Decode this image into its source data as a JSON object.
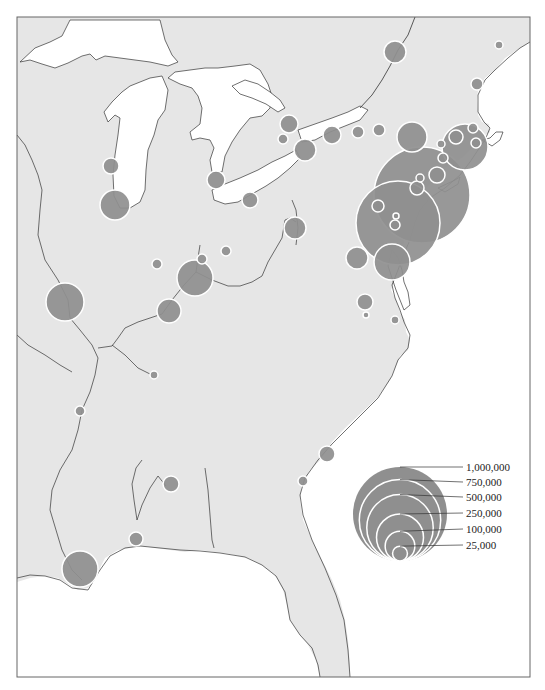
{
  "map": {
    "colors": {
      "land": "#e6e6e6",
      "water": "#ffffff",
      "circle_fill": "#8f8f8f",
      "circle_stroke": "#ffffff",
      "border": "#333333",
      "frame": "#666666"
    },
    "legend": {
      "title": "",
      "entries": [
        {
          "label": "1,000,000",
          "value": 1000000
        },
        {
          "label": "750,000",
          "value": 750000
        },
        {
          "label": "500,000",
          "value": 500000
        },
        {
          "label": "250,000",
          "value": 250000
        },
        {
          "label": "100,000",
          "value": 100000
        },
        {
          "label": "25,000",
          "value": 25000
        }
      ]
    },
    "cities": [
      {
        "x": 395,
        "y": 52,
        "r": 11
      },
      {
        "x": 499,
        "y": 45,
        "r": 4
      },
      {
        "x": 477,
        "y": 84,
        "r": 6
      },
      {
        "x": 289,
        "y": 124,
        "r": 9
      },
      {
        "x": 283,
        "y": 139,
        "r": 5
      },
      {
        "x": 305,
        "y": 150,
        "r": 11
      },
      {
        "x": 332,
        "y": 135,
        "r": 9
      },
      {
        "x": 358,
        "y": 132,
        "r": 6
      },
      {
        "x": 379,
        "y": 130,
        "r": 6
      },
      {
        "x": 412,
        "y": 137,
        "r": 15
      },
      {
        "x": 422,
        "y": 195,
        "r": 48
      },
      {
        "x": 398,
        "y": 223,
        "r": 42
      },
      {
        "x": 465,
        "y": 147,
        "r": 23
      },
      {
        "x": 456,
        "y": 137,
        "r": 7
      },
      {
        "x": 473,
        "y": 128,
        "r": 5
      },
      {
        "x": 476,
        "y": 143,
        "r": 5
      },
      {
        "x": 441,
        "y": 144,
        "r": 4
      },
      {
        "x": 443,
        "y": 158,
        "r": 5
      },
      {
        "x": 437,
        "y": 175,
        "r": 8
      },
      {
        "x": 417,
        "y": 188,
        "r": 7
      },
      {
        "x": 420,
        "y": 178,
        "r": 4
      },
      {
        "x": 378,
        "y": 206,
        "r": 6
      },
      {
        "x": 396,
        "y": 216,
        "r": 3
      },
      {
        "x": 395,
        "y": 225,
        "r": 5
      },
      {
        "x": 392,
        "y": 262,
        "r": 18
      },
      {
        "x": 357,
        "y": 258,
        "r": 11
      },
      {
        "x": 365,
        "y": 302,
        "r": 8
      },
      {
        "x": 366,
        "y": 315,
        "r": 3
      },
      {
        "x": 395,
        "y": 320,
        "r": 4
      },
      {
        "x": 111,
        "y": 166,
        "r": 8
      },
      {
        "x": 115,
        "y": 205,
        "r": 15
      },
      {
        "x": 216,
        "y": 180,
        "r": 9
      },
      {
        "x": 250,
        "y": 200,
        "r": 8
      },
      {
        "x": 295,
        "y": 228,
        "r": 11
      },
      {
        "x": 226,
        "y": 251,
        "r": 5
      },
      {
        "x": 157,
        "y": 264,
        "r": 5
      },
      {
        "x": 202,
        "y": 259,
        "r": 5
      },
      {
        "x": 195,
        "y": 278,
        "r": 18
      },
      {
        "x": 169,
        "y": 311,
        "r": 12
      },
      {
        "x": 65,
        "y": 302,
        "r": 19
      },
      {
        "x": 154,
        "y": 375,
        "r": 4
      },
      {
        "x": 80,
        "y": 411,
        "r": 5
      },
      {
        "x": 327,
        "y": 454,
        "r": 8
      },
      {
        "x": 303,
        "y": 481,
        "r": 5
      },
      {
        "x": 171,
        "y": 484,
        "r": 8
      },
      {
        "x": 136,
        "y": 539,
        "r": 7
      },
      {
        "x": 80,
        "y": 569,
        "r": 18
      }
    ]
  }
}
